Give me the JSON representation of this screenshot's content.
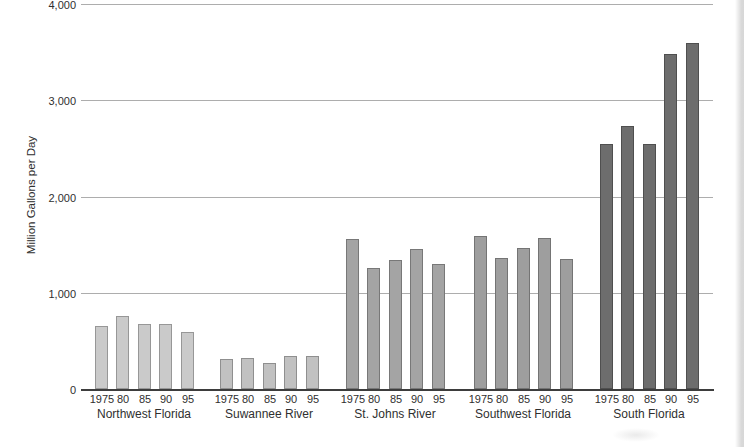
{
  "figure": {
    "background": "#ffffff",
    "text_color": "#2f2f2f",
    "grid_color": "#adadad",
    "axis_color": "#3d3d3d"
  },
  "chart_data": {
    "type": "bar",
    "title": "",
    "ylabel": "Million Gallons per Day",
    "xlabel": "",
    "ylim": [
      0,
      4000
    ],
    "yticks": [
      0,
      1000,
      2000,
      3000,
      4000
    ],
    "ytick_labels": [
      "0",
      "1,000",
      "2,000",
      "3,000",
      "4,000"
    ],
    "grid": "horizontal",
    "legend_position": "none",
    "categories": [
      "1975",
      "80",
      "85",
      "90",
      "95"
    ],
    "series": [
      {
        "name": "Northwest Florida",
        "fill": "#cacaca",
        "edge": "#979797",
        "values": [
          650,
          760,
          680,
          680,
          590
        ]
      },
      {
        "name": "Suwannee River",
        "fill": "#c1c1c1",
        "edge": "#8f8f8f",
        "values": [
          310,
          320,
          270,
          340,
          340
        ]
      },
      {
        "name": "St. Johns River",
        "fill": "#a4a4a4",
        "edge": "#787878",
        "values": [
          1560,
          1260,
          1340,
          1460,
          1300
        ]
      },
      {
        "name": "Southwest Florida",
        "fill": "#9e9e9e",
        "edge": "#747474",
        "values": [
          1590,
          1360,
          1470,
          1570,
          1350
        ]
      },
      {
        "name": "South Florida",
        "fill": "#6d6d6d",
        "edge": "#4f4f4f",
        "values": [
          2550,
          2730,
          2550,
          3480,
          3600
        ]
      }
    ]
  }
}
